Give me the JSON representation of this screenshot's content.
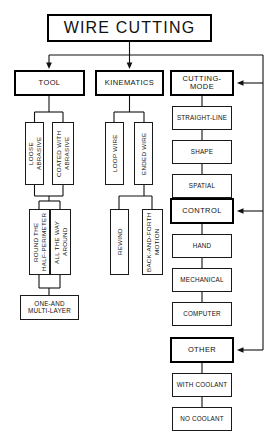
{
  "diagram": {
    "title": "WIRE CUTTING",
    "root": {
      "label": "WIRE CUTTING"
    },
    "branches": {
      "tool": {
        "label": "TOOL"
      },
      "kinematics": {
        "label": "KINEMATICS"
      },
      "cutting_mode": {
        "label": "CUTTING-MODE"
      },
      "control": {
        "label": "CONTROL"
      },
      "other": {
        "label": "OTHER"
      }
    },
    "tool_children": [
      {
        "label": "LOOSE\nABRASIVE"
      },
      {
        "label": "COATED WITH\nABRASIVE"
      }
    ],
    "tool_grandchildren": [
      {
        "label": "ROUND THE\nHALF-PERIMETER"
      },
      {
        "label": "ALL THE WAY\nAROUND"
      }
    ],
    "tool_leaf": {
      "label": "ONE-AND\nMULTI-LAYER"
    },
    "kinematics_children": [
      {
        "label": "LOOP WIRE"
      },
      {
        "label": "ENDED WIRE"
      }
    ],
    "kinematics_grandchildren": [
      {
        "label": "REWIND"
      },
      {
        "label": "BACK-AND-FORTH\nMOTION"
      }
    ],
    "cutting_mode_children": [
      {
        "label": "STRAIGHT-LINE"
      },
      {
        "label": "SHAPE"
      },
      {
        "label": "SPATIAL"
      }
    ],
    "control_children": [
      {
        "label": "HAND"
      },
      {
        "label": "MECHANICAL"
      },
      {
        "label": "COMPUTER"
      }
    ],
    "other_children": [
      {
        "label": "WITH COOLANT"
      },
      {
        "label": "NO COOLANT"
      }
    ],
    "colors": {
      "stroke": "#1a1a1a",
      "bold_stroke": "#000000",
      "background": "#ffffff",
      "text": "#111111"
    }
  }
}
